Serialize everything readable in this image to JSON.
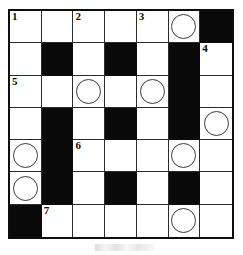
{
  "puzzle": {
    "title": "Crossword Grid",
    "type": "crossword",
    "rows": 7,
    "columns": 7,
    "colors": {
      "block": "#0a0a0a",
      "open": "#ffffff",
      "grid_line": "#2b2b2b",
      "border": "#0d0d0d",
      "circle_stroke": "#3a3a3a",
      "number": "#0a0a0a"
    },
    "legend": {
      "open_cell": "white answer square",
      "block_cell": "black blocked square",
      "circle_cell": "white square with circled letter marker"
    },
    "clue_numbers": [
      {
        "number": "1",
        "row": 1,
        "col": 1
      },
      {
        "number": "2",
        "row": 1,
        "col": 3
      },
      {
        "number": "3",
        "row": 1,
        "col": 5
      },
      {
        "number": "4",
        "row": 2,
        "col": 7
      },
      {
        "number": "5",
        "row": 3,
        "col": 1
      },
      {
        "number": "6",
        "row": 5,
        "col": 3
      },
      {
        "number": "7",
        "row": 7,
        "col": 2
      }
    ],
    "circled_cells": [
      {
        "row": 1,
        "col": 6
      },
      {
        "row": 3,
        "col": 3
      },
      {
        "row": 3,
        "col": 5
      },
      {
        "row": 4,
        "col": 7
      },
      {
        "row": 5,
        "col": 1
      },
      {
        "row": 5,
        "col": 6
      },
      {
        "row": 6,
        "col": 1
      },
      {
        "row": 7,
        "col": 6
      }
    ],
    "grid": [
      [
        {
          "state": "open",
          "number": "1",
          "circle": false
        },
        {
          "state": "open",
          "number": "",
          "circle": false
        },
        {
          "state": "open",
          "number": "2",
          "circle": false
        },
        {
          "state": "open",
          "number": "",
          "circle": false
        },
        {
          "state": "open",
          "number": "3",
          "circle": false
        },
        {
          "state": "open",
          "number": "",
          "circle": true
        },
        {
          "state": "block",
          "number": "",
          "circle": false
        }
      ],
      [
        {
          "state": "open",
          "number": "",
          "circle": false
        },
        {
          "state": "block",
          "number": "",
          "circle": false
        },
        {
          "state": "open",
          "number": "",
          "circle": false
        },
        {
          "state": "block",
          "number": "",
          "circle": false
        },
        {
          "state": "open",
          "number": "",
          "circle": false
        },
        {
          "state": "block",
          "number": "",
          "circle": false
        },
        {
          "state": "open",
          "number": "4",
          "circle": false
        }
      ],
      [
        {
          "state": "open",
          "number": "5",
          "circle": false
        },
        {
          "state": "open",
          "number": "",
          "circle": false
        },
        {
          "state": "open",
          "number": "",
          "circle": true
        },
        {
          "state": "open",
          "number": "",
          "circle": false
        },
        {
          "state": "open",
          "number": "",
          "circle": true
        },
        {
          "state": "block",
          "number": "",
          "circle": false
        },
        {
          "state": "open",
          "number": "",
          "circle": false
        }
      ],
      [
        {
          "state": "open",
          "number": "",
          "circle": false
        },
        {
          "state": "block",
          "number": "",
          "circle": false
        },
        {
          "state": "open",
          "number": "",
          "circle": false
        },
        {
          "state": "block",
          "number": "",
          "circle": false
        },
        {
          "state": "open",
          "number": "",
          "circle": false
        },
        {
          "state": "block",
          "number": "",
          "circle": false
        },
        {
          "state": "open",
          "number": "",
          "circle": true
        }
      ],
      [
        {
          "state": "open",
          "number": "",
          "circle": true
        },
        {
          "state": "block",
          "number": "",
          "circle": false
        },
        {
          "state": "open",
          "number": "6",
          "circle": false
        },
        {
          "state": "open",
          "number": "",
          "circle": false
        },
        {
          "state": "open",
          "number": "",
          "circle": false
        },
        {
          "state": "open",
          "number": "",
          "circle": true
        },
        {
          "state": "open",
          "number": "",
          "circle": false
        }
      ],
      [
        {
          "state": "open",
          "number": "",
          "circle": true
        },
        {
          "state": "block",
          "number": "",
          "circle": false
        },
        {
          "state": "open",
          "number": "",
          "circle": false
        },
        {
          "state": "block",
          "number": "",
          "circle": false
        },
        {
          "state": "open",
          "number": "",
          "circle": false
        },
        {
          "state": "block",
          "number": "",
          "circle": false
        },
        {
          "state": "open",
          "number": "",
          "circle": false
        }
      ],
      [
        {
          "state": "block",
          "number": "",
          "circle": false
        },
        {
          "state": "open",
          "number": "7",
          "circle": false
        },
        {
          "state": "open",
          "number": "",
          "circle": false
        },
        {
          "state": "open",
          "number": "",
          "circle": false
        },
        {
          "state": "open",
          "number": "",
          "circle": false
        },
        {
          "state": "open",
          "number": "",
          "circle": true
        },
        {
          "state": "open",
          "number": "",
          "circle": false
        }
      ]
    ]
  }
}
